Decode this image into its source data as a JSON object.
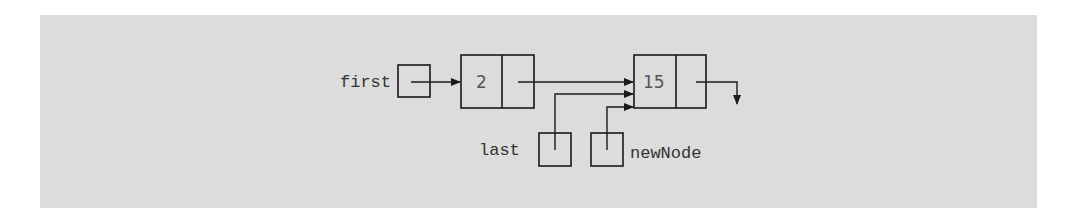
{
  "diagram": {
    "title": "",
    "background_color": "#dcdcdc",
    "line_color": "#1a1a1a",
    "pointers": [
      {
        "name": "first",
        "points_to": "node-2"
      },
      {
        "name": "last",
        "points_to": "node-15"
      },
      {
        "name": "newNode",
        "points_to": "node-15"
      }
    ],
    "nodes": [
      {
        "info": "2",
        "link": "node-15"
      },
      {
        "info": "15",
        "link": "null"
      }
    ]
  }
}
